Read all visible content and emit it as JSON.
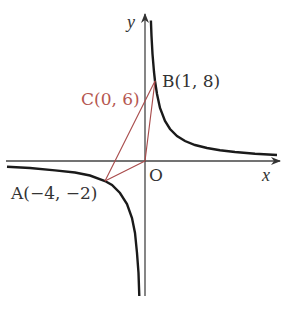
{
  "diagram": {
    "type": "coordinate-graph",
    "function": "y = 8/x",
    "axes": {
      "x_label": "x",
      "y_label": "y",
      "origin_label": "O"
    },
    "points": [
      {
        "id": "A",
        "label": "A(−4, −2)",
        "x": -4,
        "y": -2
      },
      {
        "id": "B",
        "label": "B(1, 8)",
        "x": 1,
        "y": 8
      },
      {
        "id": "C",
        "label": "C(0, 6)",
        "x": 0,
        "y": 6
      }
    ],
    "segments": [
      "A-B",
      "A-O",
      "O-B"
    ],
    "colors": {
      "curve": "#1a1a1a",
      "axis": "#444444",
      "segment": "#a84a4a",
      "c_label": "#b5564f",
      "text": "#333333"
    }
  }
}
